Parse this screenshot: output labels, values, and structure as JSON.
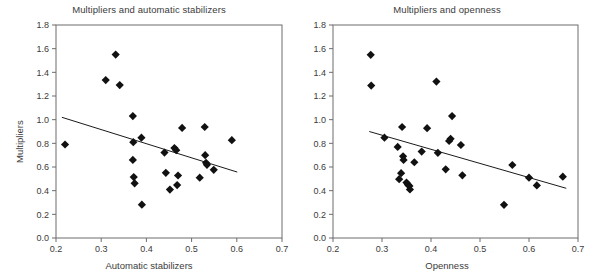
{
  "figure": {
    "width": 596,
    "height": 280,
    "background": "#ffffff",
    "marker_color": "#111111",
    "axis_color": "#6d6d6d",
    "line_color": "#1a1a1a",
    "text_color": "#3b3b3b"
  },
  "chart_data": [
    {
      "type": "scatter",
      "title": "Multipliers and automatic stabilizers",
      "xlabel": "Automatic stabilizers",
      "ylabel": "Multipliers",
      "xlim": [
        0.2,
        0.7
      ],
      "ylim": [
        0.0,
        1.8
      ],
      "xticks": [
        "0.2",
        "0.3",
        "0.4",
        "0.5",
        "0.6",
        "0.7"
      ],
      "xtick_values": [
        0.2,
        0.3,
        0.4,
        0.5,
        0.6,
        0.7
      ],
      "yticks": [
        "0.0",
        "0.2",
        "0.4",
        "0.6",
        "0.8",
        "1.0",
        "1.2",
        "1.4",
        "1.6",
        "1.8"
      ],
      "ytick_values": [
        0.0,
        0.2,
        0.4,
        0.6,
        0.8,
        1.0,
        1.2,
        1.4,
        1.6,
        1.8
      ],
      "grid": false,
      "legend": "none",
      "marker": "diamond",
      "points": [
        [
          0.22,
          0.79
        ],
        [
          0.31,
          1.335
        ],
        [
          0.332,
          1.55
        ],
        [
          0.341,
          1.292
        ],
        [
          0.37,
          1.03
        ],
        [
          0.371,
          0.81
        ],
        [
          0.37,
          0.66
        ],
        [
          0.372,
          0.515
        ],
        [
          0.374,
          0.462
        ],
        [
          0.389,
          0.848
        ],
        [
          0.39,
          0.282
        ],
        [
          0.44,
          0.722
        ],
        [
          0.443,
          0.551
        ],
        [
          0.452,
          0.409
        ],
        [
          0.462,
          0.76
        ],
        [
          0.466,
          0.742
        ],
        [
          0.47,
          0.528
        ],
        [
          0.468,
          0.447
        ],
        [
          0.479,
          0.93
        ],
        [
          0.518,
          0.51
        ],
        [
          0.529,
          0.938
        ],
        [
          0.53,
          0.7
        ],
        [
          0.532,
          0.636
        ],
        [
          0.534,
          0.618
        ],
        [
          0.549,
          0.576
        ],
        [
          0.589,
          0.827
        ]
      ],
      "trendline": {
        "x": [
          0.213,
          0.601
        ],
        "y": [
          1.02,
          0.557
        ]
      }
    },
    {
      "type": "scatter",
      "title": "Multipliers and openness",
      "xlabel": "Openness",
      "ylabel": "",
      "xlim": [
        0.2,
        0.7
      ],
      "ylim": [
        0.0,
        1.8
      ],
      "xticks": [
        "0.2",
        "0.3",
        "0.4",
        "0.5",
        "0.6",
        "0.7"
      ],
      "xtick_values": [
        0.2,
        0.3,
        0.4,
        0.5,
        0.6,
        0.7
      ],
      "yticks": [
        "0.0",
        "0.2",
        "0.4",
        "0.6",
        "0.8",
        "1.0",
        "1.2",
        "1.4",
        "1.6",
        "1.8"
      ],
      "ytick_values": [
        0.0,
        0.2,
        0.4,
        0.6,
        0.8,
        1.0,
        1.2,
        1.4,
        1.6,
        1.8
      ],
      "grid": false,
      "legend": "none",
      "marker": "diamond",
      "points": [
        [
          0.277,
          1.548
        ],
        [
          0.278,
          1.288
        ],
        [
          0.305,
          0.848
        ],
        [
          0.332,
          0.77
        ],
        [
          0.335,
          0.497
        ],
        [
          0.339,
          0.548
        ],
        [
          0.341,
          0.938
        ],
        [
          0.343,
          0.69
        ],
        [
          0.344,
          0.66
        ],
        [
          0.35,
          0.468
        ],
        [
          0.353,
          0.45
        ],
        [
          0.356,
          0.44
        ],
        [
          0.357,
          0.41
        ],
        [
          0.366,
          0.64
        ],
        [
          0.381,
          0.73
        ],
        [
          0.392,
          0.928
        ],
        [
          0.411,
          1.322
        ],
        [
          0.414,
          0.72
        ],
        [
          0.43,
          0.58
        ],
        [
          0.437,
          0.82
        ],
        [
          0.44,
          0.838
        ],
        [
          0.443,
          1.03
        ],
        [
          0.461,
          0.786
        ],
        [
          0.464,
          0.53
        ],
        [
          0.549,
          0.28
        ],
        [
          0.566,
          0.617
        ],
        [
          0.6,
          0.51
        ],
        [
          0.616,
          0.444
        ],
        [
          0.669,
          0.518
        ]
      ],
      "trendline": {
        "x": [
          0.274,
          0.676
        ],
        "y": [
          0.9,
          0.42
        ]
      }
    }
  ]
}
